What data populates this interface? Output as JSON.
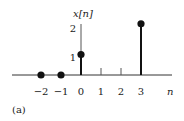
{
  "chart_data": {
    "type": "stem",
    "title": "",
    "xlabel": "n",
    "ylabel": "x[n]",
    "caption": "(a)",
    "x": [
      -2,
      -1,
      0,
      1,
      2,
      3
    ],
    "values": [
      0,
      0,
      1,
      0,
      0,
      2.5
    ],
    "xticks": [
      -2,
      -1,
      0,
      1,
      2,
      3
    ],
    "xtick_labels": [
      "−2",
      "−1",
      "0",
      "1",
      "2",
      "3"
    ],
    "yticks": [
      1,
      2
    ],
    "ytick_labels": [
      "1",
      "2"
    ],
    "xlim": [
      -3.5,
      4.5
    ],
    "ylim": [
      0,
      2.7
    ],
    "markers_at": [
      -2,
      -1,
      0,
      3
    ],
    "grid": false
  }
}
